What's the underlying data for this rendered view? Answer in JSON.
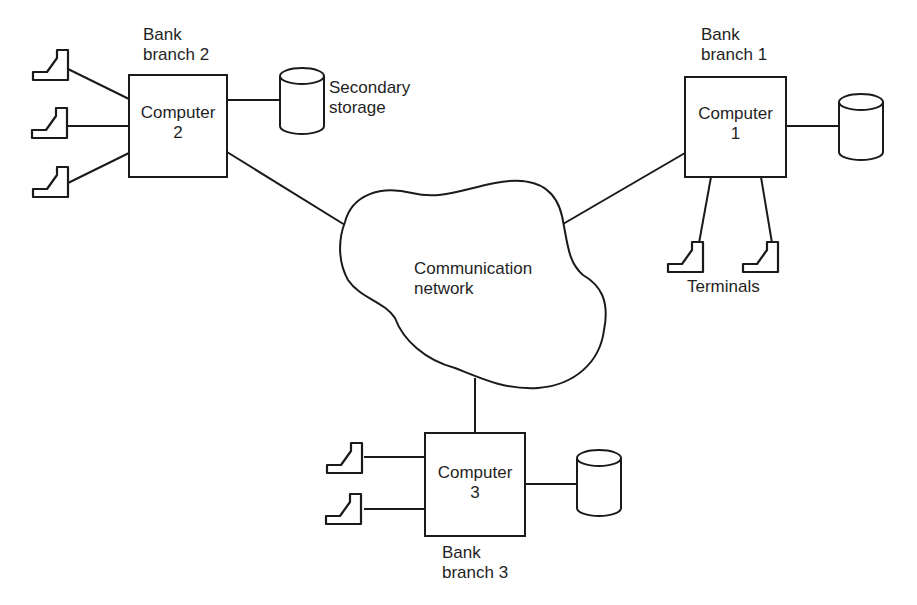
{
  "diagram": {
    "type": "network-topology",
    "network": {
      "label_line1": "Communication",
      "label_line2": "network"
    },
    "nodes": [
      {
        "id": "computer-1",
        "label_line1": "Computer",
        "label_line2": "1",
        "site_line1": "Bank",
        "site_line2": "branch 1",
        "terminals": 2,
        "storage": true
      },
      {
        "id": "computer-2",
        "label_line1": "Computer",
        "label_line2": "2",
        "site_line1": "Bank",
        "site_line2": "branch 2",
        "terminals": 3,
        "storage": true
      },
      {
        "id": "computer-3",
        "label_line1": "Computer",
        "label_line2": "3",
        "site_line1": "Bank",
        "site_line2": "branch 3",
        "terminals": 2,
        "storage": true
      }
    ],
    "annotations": {
      "storage_line1": "Secondary",
      "storage_line2": "storage",
      "terminals": "Terminals"
    },
    "colors": {
      "stroke": "#1a1a1a",
      "background": "#ffffff"
    }
  }
}
